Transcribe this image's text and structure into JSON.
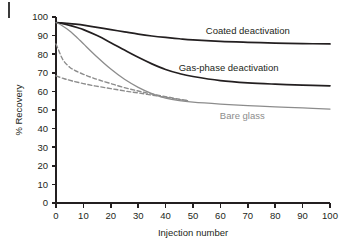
{
  "figure": {
    "background_color": "#ffffff",
    "axis_color": "#231f20",
    "corner_mark": "page-edge-mark"
  },
  "chart_data": {
    "type": "line",
    "title": "",
    "xlabel": "Injection number",
    "ylabel": "% Recovery",
    "xlim": [
      0,
      100
    ],
    "ylim": [
      0,
      100
    ],
    "xticks": [
      0,
      10,
      20,
      30,
      40,
      50,
      60,
      70,
      80,
      90,
      100
    ],
    "yticks": [
      0,
      10,
      20,
      30,
      40,
      50,
      60,
      70,
      80,
      90,
      100
    ],
    "grid": false,
    "legend_position": "inline-annotations",
    "series": [
      {
        "name": "Coated deactivation",
        "style": "solid",
        "color": "#231f20",
        "label_x": 70,
        "label_y": 91,
        "x": [
          0,
          2,
          5,
          8,
          10,
          15,
          20,
          25,
          30,
          35,
          40,
          45,
          50,
          60,
          70,
          80,
          90,
          100
        ],
        "values": [
          97,
          96.8,
          96.4,
          96.0,
          95.6,
          94.4,
          93.2,
          92.0,
          90.8,
          89.8,
          89.0,
          88.3,
          87.7,
          86.9,
          86.4,
          86.0,
          85.7,
          85.5
        ]
      },
      {
        "name": "Gas-phase deactivation",
        "style": "solid",
        "color": "#231f20",
        "label_x": 63,
        "label_y": 71,
        "x": [
          0,
          2,
          5,
          8,
          10,
          15,
          20,
          25,
          30,
          35,
          40,
          45,
          50,
          60,
          70,
          80,
          90,
          100
        ],
        "values": [
          97,
          96.5,
          95.5,
          94.2,
          93.2,
          90.0,
          86.2,
          82.2,
          78.3,
          74.8,
          71.8,
          69.6,
          68.0,
          65.8,
          64.6,
          63.9,
          63.4,
          63.0
        ]
      },
      {
        "name": "Bare glass",
        "style": "solid",
        "color": "#8c8c8c",
        "label_x": 68,
        "label_y": 45,
        "x": [
          0,
          2,
          5,
          8,
          10,
          15,
          20,
          25,
          30,
          35,
          40,
          45,
          50,
          60,
          70,
          80,
          90,
          100
        ],
        "values": [
          97,
          95.6,
          92.5,
          88.5,
          85.6,
          78.5,
          72.0,
          66.5,
          62.2,
          58.8,
          56.4,
          55.0,
          54.2,
          53.2,
          52.4,
          51.7,
          51.1,
          50.5
        ]
      },
      {
        "name": "dashed-upper",
        "style": "dashed",
        "color": "#8c8c8c",
        "x": [
          0,
          1,
          2,
          3,
          5,
          7,
          10,
          13,
          16,
          20,
          25,
          30,
          35,
          40,
          45,
          48
        ],
        "values": [
          85.5,
          82.0,
          78.5,
          76.0,
          73.0,
          71.2,
          69.2,
          67.5,
          66.0,
          64.2,
          62.0,
          60.2,
          58.6,
          57.2,
          55.8,
          55.0
        ]
      },
      {
        "name": "dashed-lower",
        "style": "dashed",
        "color": "#8c8c8c",
        "x": [
          0,
          3,
          6,
          10,
          14,
          18,
          22,
          26,
          30,
          35,
          40,
          45,
          48
        ],
        "values": [
          68.3,
          66.8,
          65.6,
          64.2,
          63.0,
          62.0,
          61.0,
          60.0,
          59.2,
          58.0,
          56.8,
          55.6,
          55.0
        ]
      }
    ]
  }
}
